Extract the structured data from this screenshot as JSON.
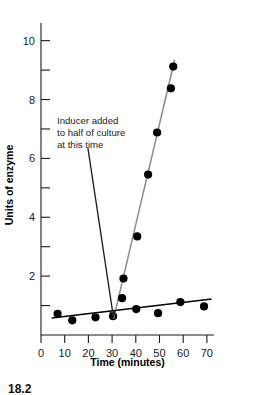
{
  "figure": {
    "caption": "18.2"
  },
  "chart_data": {
    "type": "scatter",
    "title": "",
    "xlabel": "Time (minutes)",
    "ylabel": "Units of enzyme",
    "xlim": [
      0,
      73
    ],
    "ylim": [
      0,
      10.6
    ],
    "xticks": [
      0,
      10,
      20,
      30,
      40,
      50,
      60,
      70
    ],
    "xtick_labels": [
      "0",
      "10",
      "20",
      "30",
      "40",
      "50",
      "60",
      "70"
    ],
    "yticks": [
      2,
      4,
      6,
      8,
      10
    ],
    "ytick_labels": [
      "2",
      "4",
      "6",
      "8",
      "10"
    ],
    "y_minor_ticks": [
      1,
      3,
      5,
      7,
      9
    ],
    "grid": false,
    "legend": "none",
    "series": [
      {
        "name": "Uninduced culture",
        "color": "#000000",
        "marker": "filled-circle",
        "trendline": "linear",
        "trend_endpoints": [
          [
            4.5,
            0.58
          ],
          [
            72.0,
            1.22
          ]
        ],
        "points": [
          [
            7.0,
            0.72
          ],
          [
            13.2,
            0.5
          ],
          [
            23.0,
            0.6
          ],
          [
            30.4,
            0.64
          ],
          [
            40.2,
            0.88
          ],
          [
            49.4,
            0.74
          ],
          [
            58.8,
            1.12
          ],
          [
            68.8,
            0.97
          ]
        ]
      },
      {
        "name": "Induced culture",
        "color": "#8c8c8c",
        "marker": "filled-circle",
        "trendline": "linear",
        "trend_endpoints": [
          [
            30.6,
            0.55
          ],
          [
            56.4,
            9.35
          ]
        ],
        "points": [
          [
            34.2,
            1.25
          ],
          [
            34.8,
            1.92
          ],
          [
            40.6,
            3.35
          ],
          [
            45.2,
            5.45
          ],
          [
            49.0,
            6.88
          ],
          [
            54.8,
            8.38
          ],
          [
            55.8,
            9.12
          ]
        ]
      }
    ],
    "annotations": [
      {
        "name": "inducer-annotation",
        "lines": [
          "Inducer added",
          "to half of culture",
          "at this time"
        ],
        "arrow_from": [
          19.8,
          6.35
        ],
        "arrow_to": [
          30.2,
          0.8
        ]
      }
    ]
  }
}
